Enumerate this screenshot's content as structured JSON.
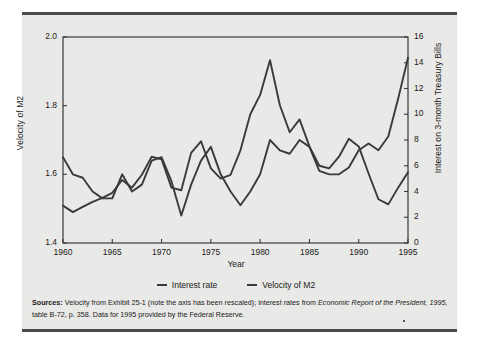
{
  "figure": {
    "background": "#e9e9e7",
    "rule_color": "#4a4a4a",
    "line_color": "#3a3a3a"
  },
  "legend": {
    "items": [
      {
        "label": "Interest rate",
        "color": "#3a3a3a"
      },
      {
        "label": "Velocity of M2",
        "color": "#3a3a3a"
      }
    ]
  },
  "sources": {
    "heading": "Sources:",
    "part1": " Velocity from Exhibit 25-1 (note the axis has been rescaled); interest rates from ",
    "italic1": "Economic Report of the President, 1995,",
    "part2": " table B-72, p. 358. Data for 1995 provided by the Federal Reserve."
  },
  "chart_data": {
    "type": "line",
    "title": "",
    "xlabel": "Year",
    "ylabel": "Velocity of M2",
    "ylabel_right": "Interest on 3-month Treasury Bills",
    "xlim": [
      1960,
      1995
    ],
    "ylim": [
      1.4,
      2.0
    ],
    "ylim_right": [
      0,
      16
    ],
    "grid": false,
    "legend_position": "bottom",
    "xticks": [
      1960,
      1965,
      1970,
      1975,
      1980,
      1985,
      1990,
      1995
    ],
    "xtick_labels": [
      "1960",
      "1965",
      "1970",
      "1975",
      "1980",
      "1985",
      "1990",
      "1995"
    ],
    "yticks_left": [
      1.4,
      1.6,
      1.8,
      2.0
    ],
    "ytick_labels_left": [
      "1.4",
      "1.6",
      "1.8",
      "2.0"
    ],
    "yticks_right": [
      0,
      2,
      4,
      6,
      8,
      10,
      12,
      14,
      16
    ],
    "ytick_labels_right": [
      "0",
      "2",
      "4",
      "6",
      "8",
      "10",
      "12",
      "14",
      "16"
    ],
    "x": [
      1960,
      1961,
      1962,
      1963,
      1964,
      1965,
      1966,
      1967,
      1968,
      1969,
      1970,
      1971,
      1972,
      1973,
      1974,
      1975,
      1976,
      1977,
      1978,
      1979,
      1980,
      1981,
      1982,
      1983,
      1984,
      1985,
      1986,
      1987,
      1988,
      1989,
      1990,
      1991,
      1992,
      1993,
      1994,
      1995
    ],
    "series": [
      {
        "name": "Interest rate",
        "axis": "right",
        "values": [
          2.9,
          2.4,
          2.8,
          3.2,
          3.5,
          3.9,
          4.9,
          4.3,
          5.3,
          6.7,
          6.5,
          4.3,
          4.1,
          7.0,
          7.9,
          5.8,
          5.0,
          5.3,
          7.2,
          10.0,
          11.5,
          14.2,
          10.7,
          8.6,
          9.6,
          7.5,
          6.0,
          5.8,
          6.7,
          8.1,
          7.5,
          5.4,
          3.4,
          3.0,
          4.3,
          5.5
        ]
      },
      {
        "name": "Velocity of M2",
        "axis": "left",
        "values": [
          1.65,
          1.6,
          1.59,
          1.55,
          1.53,
          1.53,
          1.6,
          1.55,
          1.57,
          1.64,
          1.65,
          1.58,
          1.48,
          1.57,
          1.64,
          1.68,
          1.6,
          1.55,
          1.51,
          1.55,
          1.6,
          1.7,
          1.67,
          1.66,
          1.7,
          1.68,
          1.61,
          1.6,
          1.6,
          1.62,
          1.67,
          1.69,
          1.67,
          1.71,
          1.82,
          1.94
        ]
      }
    ]
  }
}
